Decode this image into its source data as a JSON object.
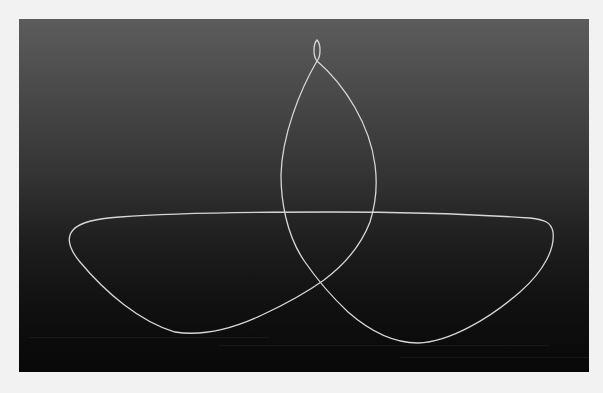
{
  "figure": {
    "background": {
      "outer_color": "#f2f2f2",
      "panel_top_color": "#5c5c5c",
      "panel_bottom_color": "#080808"
    },
    "curve": {
      "stroke_color": "#d8d8d8",
      "stroke_width": 1.3,
      "features": [
        {
          "name": "top-small-loop",
          "center_x": 317,
          "top_y": 40,
          "cross_y": 61
        },
        {
          "name": "upper-lens",
          "left_x": 281,
          "right_x": 376,
          "mid_y": 180
        },
        {
          "name": "horizontal-span",
          "y": 212,
          "left_x": 95,
          "right_x": 540
        },
        {
          "name": "left-lobe",
          "leftmost": [
            68,
            240
          ],
          "bottom": [
            190,
            333
          ]
        },
        {
          "name": "right-lobe",
          "rightmost": [
            553,
            240
          ],
          "bottom": [
            415,
            343
          ]
        },
        {
          "name": "lower-crossing",
          "point": [
            324,
            280
          ]
        }
      ]
    }
  }
}
